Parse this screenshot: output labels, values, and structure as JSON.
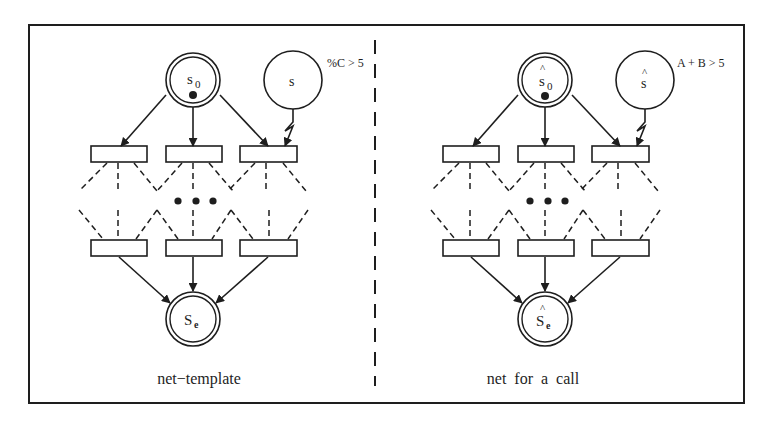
{
  "colors": {
    "ink": "#1e1e1e",
    "background": "#ffffff"
  },
  "panels": [
    {
      "id": "left",
      "caption": "net−template",
      "start_place": {
        "label": "s",
        "subscript": "0",
        "hat": ""
      },
      "side_place": {
        "label": "s",
        "hat": ""
      },
      "end_place": {
        "label": "S",
        "subscript": "e",
        "hat": ""
      },
      "guard": "%C > 5",
      "ellipsis": "• • •"
    },
    {
      "id": "right",
      "caption": "net  for  a  call",
      "start_place": {
        "label": "s",
        "subscript": "0",
        "hat": "^"
      },
      "side_place": {
        "label": "s",
        "hat": "^"
      },
      "end_place": {
        "label": "S",
        "subscript": "e",
        "hat": "^"
      },
      "guard": "A + B > 5",
      "ellipsis": "• • •"
    }
  ]
}
